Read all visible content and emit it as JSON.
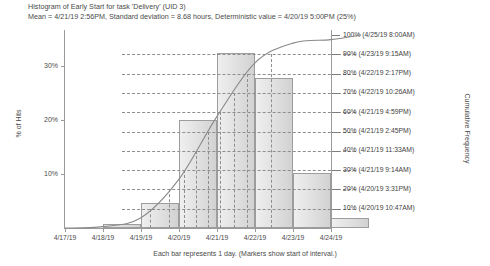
{
  "header": {
    "title": "Histogram of Early Start for task 'Delivery' (UID 3)",
    "subtitle": "Mean = 4/21/19 2:56PM, Standard deviation = 8.68 hours, Deterministic value = 4/20/19 5:00PM (25%)"
  },
  "footer": {
    "caption": "Each bar represents 1 day.  (Markers show start of interval.)"
  },
  "axes": {
    "y_left_title": "% of Hits",
    "y_right_title": "Cumulative Frequency"
  },
  "chart_data": {
    "type": "bar",
    "title": "Histogram of Early Start for task 'Delivery' (UID 3)",
    "subtitle": "Mean = 4/21/19 2:56PM, Standard deviation = 8.68 hours, Deterministic value = 4/20/19 5:00PM (25%)",
    "xlabel": "",
    "ylabel": "% of Hits",
    "y2label": "Cumulative Frequency",
    "grid": false,
    "legend": "none",
    "categories": [
      "4/17/19",
      "4/18/19",
      "4/19/19",
      "4/20/19",
      "4/21/19",
      "4/22/19",
      "4/23/19",
      "4/24/19"
    ],
    "values": [
      0,
      0.7,
      4.6,
      20.0,
      32.5,
      27.8,
      10.2,
      1.8
    ],
    "ylim": [
      0,
      35
    ],
    "ytick_labels": [
      "10%",
      "20%",
      "30%"
    ],
    "ytick_values": [
      10,
      20,
      30
    ],
    "y2lim": [
      0,
      100
    ],
    "series": [
      {
        "name": "Histogram",
        "type": "bar",
        "values": [
          0,
          0.7,
          4.6,
          20.0,
          32.5,
          27.8,
          10.2,
          1.8
        ]
      },
      {
        "name": "Cumulative Frequency",
        "type": "line",
        "values": [
          0,
          0.7,
          5.3,
          25.3,
          57.8,
          85.6,
          95.8,
          97.6
        ]
      }
    ],
    "percentiles": [
      {
        "label": "100% (4/25/19 8:00AM)",
        "pct": 100,
        "date": "4/25/19 8:00AM"
      },
      {
        "label": "90% (4/23/19 9:15AM)",
        "pct": 90,
        "date": "4/23/19 9:15AM"
      },
      {
        "label": "80% (4/22/19 2:17PM)",
        "pct": 80,
        "date": "4/22/19 2:17PM"
      },
      {
        "label": "70% (4/22/19 10:26AM)",
        "pct": 70,
        "date": "4/22/19 10:26AM"
      },
      {
        "label": "60% (4/21/19 4:59PM)",
        "pct": 60,
        "date": "4/21/19 4:59PM"
      },
      {
        "label": "50% (4/21/19 2:45PM)",
        "pct": 50,
        "date": "4/21/19 2:45PM"
      },
      {
        "label": "40% (4/21/19 11:33AM)",
        "pct": 40,
        "date": "4/21/19 11:33AM"
      },
      {
        "label": "30% (4/21/19 9:14AM)",
        "pct": 30,
        "date": "4/21/19 9:14AM"
      },
      {
        "label": "20% (4/20/19 3:31PM)",
        "pct": 20,
        "date": "4/20/19 3:31PM"
      },
      {
        "label": "10% (4/20/19 10:47AM)",
        "pct": 10,
        "date": "4/20/19 10:47AM"
      }
    ]
  },
  "colors": {
    "bar_fill": "#e2e2e2",
    "bar_stroke": "#9d9d9d",
    "axis": "#9a9a9a",
    "text": "#4a4a4a",
    "curve": "#8a8a8a",
    "dash": "#8e8e8e"
  }
}
